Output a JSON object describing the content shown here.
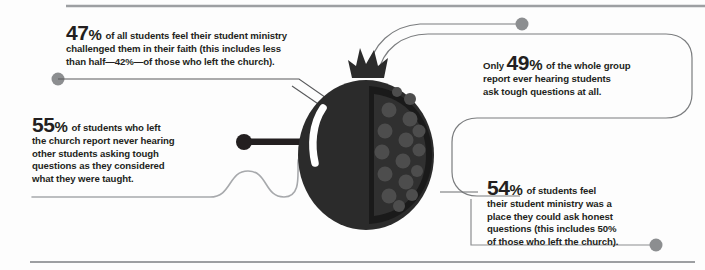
{
  "page": {
    "background_color": "#fdfdfd",
    "text_color": "#231f20",
    "accent_dark": "#2b2b2b",
    "seed_color": "#4a4a4a",
    "connector_gray": "#8c8e90",
    "connector_black": "#231f20"
  },
  "graphic": {
    "name": "pomegranate-illustration",
    "description": "Dark pomegranate with crown, white highlight arc and cut half showing seeds",
    "body_color": "#2b2b2b",
    "seed_color": "#4b4b4b",
    "highlight_color": "#ffffff",
    "seed_count": 16
  },
  "rules": {
    "top": {
      "name": "top-divider"
    },
    "bottom": {
      "name": "bottom-divider"
    },
    "stat55_underline": {
      "name": "stat-55-underline"
    }
  },
  "stats": [
    {
      "id": "stat-47",
      "value": "47",
      "percent_symbol": "%",
      "prefix": "",
      "text": " of all students feel their student ministry challenged them in their faith (this includes less than half—42%—of those who left the church).",
      "line1": " of all students feel their student ministry",
      "line2": "challenged them in their faith (this includes less",
      "line3": "than half—42%—of those who left the church).",
      "connector": "line-with-dot-left"
    },
    {
      "id": "stat-55",
      "value": "55",
      "percent_symbol": "%",
      "prefix": "",
      "text": " of students who left the church report never hearing other students asking tough questions as they considered what they were taught.",
      "line1": " of students who left",
      "line2": "the church report never hearing",
      "line3": "other students asking tough",
      "line4": "questions as they considered",
      "line5": "what they were taught.",
      "connector": "wavy-line"
    },
    {
      "id": "stat-49",
      "value": "49",
      "percent_symbol": "%",
      "prefix": "Only ",
      "text": "Only 49% of the whole group report ever hearing students ask tough questions at all.",
      "line1": " of the whole group",
      "line2": "report ever hearing students",
      "line3": "ask tough questions at all.",
      "connector": "curved-loop-with-dot"
    },
    {
      "id": "stat-54",
      "value": "54",
      "percent_symbol": "%",
      "prefix": "",
      "text": " of students feel their student ministry was a place they could ask honest questions (this includes 50% of those who left the church).",
      "line1": " of students feel",
      "line2": "their student ministry was a",
      "line3": "place they could ask honest",
      "line4": "questions (this includes 50%",
      "line5": "of those who left the church).",
      "connector": "elbow-line-with-dot"
    }
  ]
}
